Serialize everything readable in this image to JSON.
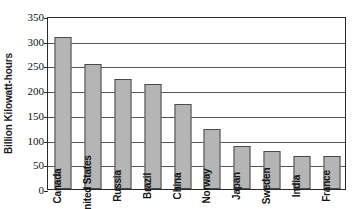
{
  "chart_data": {
    "type": "bar",
    "title": "",
    "xlabel": "",
    "ylabel": "Billion Kilowatt-hours",
    "ylim": [
      0,
      350
    ],
    "ytick_step": 50,
    "yticks": [
      350,
      300,
      250,
      200,
      150,
      100,
      50,
      0
    ],
    "ytick_labels": [
      "350",
      "300",
      "250",
      "200",
      "150",
      "100",
      "50",
      "0"
    ],
    "categories": [
      "Canada",
      "United States",
      "Russia",
      "Brazil",
      "China",
      "Norway",
      "Japan",
      "Sweden",
      "India",
      "France"
    ],
    "values": [
      308,
      253,
      222,
      212,
      172,
      122,
      87,
      77,
      66,
      66
    ],
    "grid": true,
    "legend": false,
    "bar_color": "#b5b5b5",
    "bar_edge_color": "#4a4a4a",
    "axis_color": "#2b2b2b",
    "gridline_color": "#555555",
    "background": "#ffffff"
  }
}
